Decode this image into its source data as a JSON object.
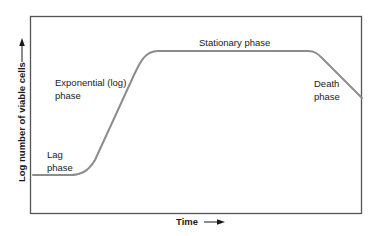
{
  "diagram": {
    "axes": {
      "x_label": "Time",
      "y_label": "Log number of viable cells",
      "x_arrow": "right-arrow-icon",
      "y_arrow": "up-arrow-icon"
    },
    "phases": [
      {
        "name": "lag",
        "lines": [
          "Lag",
          "phase"
        ]
      },
      {
        "name": "exponential",
        "lines": [
          "Exponential (log)",
          "phase"
        ]
      },
      {
        "name": "stationary",
        "lines": [
          "Stationary phase"
        ]
      },
      {
        "name": "death",
        "lines": [
          "Death",
          "phase"
        ]
      }
    ],
    "colors": {
      "curve": "#8c8c8c",
      "frame": "#555555",
      "text": "#1a1a1a",
      "background": "#ffffff"
    }
  }
}
